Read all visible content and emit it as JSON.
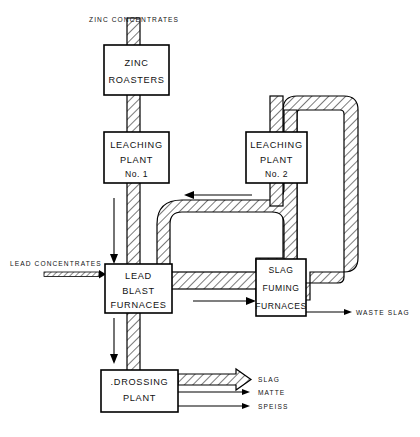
{
  "diagram": {
    "units": [
      {
        "id": "zinc-roasters",
        "lines": [
          "ZINC",
          "ROASTERS"
        ]
      },
      {
        "id": "leaching-plant-1",
        "lines": [
          "LEACHING",
          "PLANT",
          "No. 1"
        ]
      },
      {
        "id": "leaching-plant-2",
        "lines": [
          "LEACHING",
          "PLANT",
          "No. 2"
        ]
      },
      {
        "id": "lead-blast-furnaces",
        "lines": [
          "LEAD",
          "BLAST",
          "FURNACES"
        ]
      },
      {
        "id": "slag-fuming-furnaces",
        "lines": [
          "SLAG",
          "FUMING",
          "FURNACES"
        ]
      },
      {
        "id": "drossing-plant",
        "lines": [
          ".DROSSING",
          "PLANT"
        ]
      }
    ],
    "streams": {
      "zinc_concentrates": "ZINC  CONCENTRATES",
      "lead_concentrates": "LEAD  CONCENTRATES",
      "waste_slag": "WASTE  SLAG",
      "slag": "SLAG",
      "matte": "MATTE",
      "speiss": "SPEISS"
    },
    "caption": "",
    "colors": {
      "line": "#000000",
      "background": "#ffffff",
      "hatch": "#000000",
      "caption": "#c9c9c9"
    }
  }
}
